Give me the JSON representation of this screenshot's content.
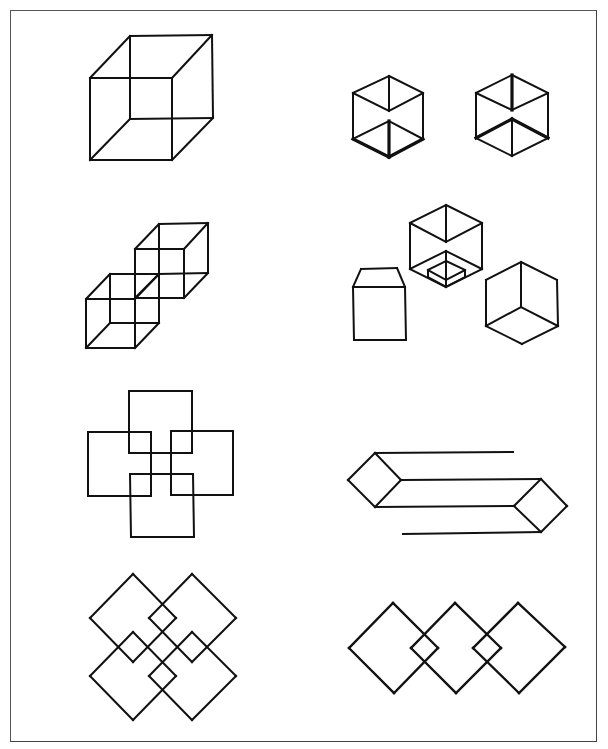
{
  "page": {
    "title": "Figure plate: line drawings of cubes and interlaced squares",
    "frame_color": "#555555",
    "stroke_color": "#111111"
  },
  "figures": [
    {
      "id": "necker-cube",
      "label": "Necker cube",
      "stroke": 2,
      "lines": [
        [
          90,
          78,
          172,
          78
        ],
        [
          172,
          78,
          172,
          160
        ],
        [
          172,
          160,
          90,
          160
        ],
        [
          90,
          160,
          90,
          78
        ],
        [
          130,
          36,
          212,
          35
        ],
        [
          212,
          35,
          213,
          118
        ],
        [
          213,
          118,
          130,
          119
        ],
        [
          130,
          119,
          130,
          36
        ],
        [
          90,
          78,
          130,
          36
        ],
        [
          172,
          78,
          212,
          35
        ],
        [
          172,
          160,
          213,
          118
        ],
        [
          90,
          160,
          130,
          119
        ]
      ]
    },
    {
      "id": "hexagon-cube-left",
      "label": "Hexagonal cube outline (left)",
      "stroke": 2,
      "lines": [
        [
          389,
          76,
          423,
          93
        ],
        [
          423,
          93,
          423,
          139
        ],
        [
          423,
          139,
          389,
          157
        ],
        [
          389,
          157,
          353,
          139
        ],
        [
          353,
          139,
          353,
          93
        ],
        [
          353,
          93,
          389,
          76
        ],
        [
          389,
          76,
          389,
          111
        ],
        [
          353,
          93,
          389,
          111
        ],
        [
          423,
          93,
          389,
          111
        ],
        [
          389,
          121,
          389,
          157
        ],
        [
          353,
          139,
          389,
          121
        ],
        [
          423,
          139,
          389,
          121
        ]
      ],
      "thick": [
        [
          353,
          139,
          389,
          157
        ],
        [
          389,
          157,
          423,
          139
        ],
        [
          389,
          121,
          389,
          157
        ]
      ]
    },
    {
      "id": "hexagon-cube-right",
      "label": "Hexagonal cube outline (right)",
      "stroke": 2,
      "lines": [
        [
          512,
          75,
          548,
          93
        ],
        [
          548,
          93,
          548,
          138
        ],
        [
          548,
          138,
          512,
          156
        ],
        [
          512,
          156,
          476,
          138
        ],
        [
          476,
          138,
          476,
          93
        ],
        [
          476,
          93,
          512,
          75
        ],
        [
          512,
          75,
          512,
          110
        ],
        [
          476,
          93,
          512,
          110
        ],
        [
          548,
          93,
          512,
          110
        ],
        [
          512,
          119,
          512,
          156
        ],
        [
          476,
          138,
          512,
          119
        ],
        [
          548,
          138,
          512,
          119
        ]
      ],
      "thick": [
        [
          512,
          75,
          512,
          110
        ],
        [
          476,
          138,
          512,
          119
        ],
        [
          548,
          138,
          512,
          119
        ]
      ]
    },
    {
      "id": "double-cube",
      "label": "Two joined wire cubes",
      "stroke": 2,
      "lines": [
        [
          86,
          299,
          135,
          299
        ],
        [
          135,
          299,
          135,
          348
        ],
        [
          135,
          348,
          86,
          348
        ],
        [
          86,
          348,
          86,
          299
        ],
        [
          110,
          274,
          159,
          274
        ],
        [
          159,
          274,
          159,
          323
        ],
        [
          159,
          323,
          110,
          323
        ],
        [
          110,
          323,
          110,
          274
        ],
        [
          86,
          299,
          110,
          274
        ],
        [
          135,
          299,
          159,
          274
        ],
        [
          135,
          348,
          159,
          323
        ],
        [
          86,
          348,
          110,
          323
        ],
        [
          135,
          249,
          184,
          249
        ],
        [
          184,
          249,
          184,
          298
        ],
        [
          184,
          298,
          135,
          298
        ],
        [
          135,
          298,
          135,
          249
        ],
        [
          159,
          224,
          208,
          223
        ],
        [
          208,
          223,
          208,
          273
        ],
        [
          208,
          273,
          159,
          274
        ],
        [
          159,
          274,
          159,
          224
        ],
        [
          135,
          249,
          159,
          224
        ],
        [
          184,
          249,
          208,
          223
        ],
        [
          184,
          298,
          208,
          273
        ],
        [
          135,
          298,
          159,
          274
        ]
      ]
    },
    {
      "id": "box-with-lid",
      "label": "Box with tapered top",
      "stroke": 2,
      "lines": [
        [
          353,
          287,
          405,
          287
        ],
        [
          405,
          287,
          406,
          340
        ],
        [
          406,
          340,
          354,
          340
        ],
        [
          354,
          340,
          353,
          287
        ],
        [
          353,
          287,
          361,
          269
        ],
        [
          361,
          269,
          397,
          268
        ],
        [
          397,
          268,
          405,
          287
        ]
      ]
    },
    {
      "id": "open-cube-with-inset",
      "label": "Hexagonal cube with inner square well",
      "stroke": 2,
      "lines": [
        [
          446,
          205,
          482,
          223
        ],
        [
          482,
          223,
          482,
          269
        ],
        [
          482,
          269,
          446,
          287
        ],
        [
          446,
          287,
          410,
          269
        ],
        [
          410,
          269,
          410,
          223
        ],
        [
          410,
          223,
          446,
          205
        ],
        [
          446,
          205,
          446,
          242
        ],
        [
          410,
          223,
          446,
          242
        ],
        [
          482,
          223,
          446,
          242
        ],
        [
          410,
          269,
          446,
          251
        ],
        [
          482,
          269,
          446,
          251
        ],
        [
          446,
          251,
          446,
          287
        ],
        [
          428,
          270,
          446,
          261
        ],
        [
          446,
          261,
          465,
          270
        ],
        [
          428,
          270,
          428,
          277
        ],
        [
          465,
          270,
          465,
          277
        ],
        [
          428,
          277,
          446,
          287
        ],
        [
          465,
          277,
          446,
          287
        ],
        [
          428,
          270,
          446,
          280
        ],
        [
          465,
          270,
          446,
          280
        ]
      ]
    },
    {
      "id": "corner-cube",
      "label": "Hexagonal cube seen from below",
      "stroke": 2,
      "lines": [
        [
          521,
          262,
          557,
          280
        ],
        [
          557,
          280,
          558,
          326
        ],
        [
          558,
          326,
          522,
          344
        ],
        [
          522,
          344,
          486,
          326
        ],
        [
          486,
          326,
          486,
          280
        ],
        [
          486,
          280,
          521,
          262
        ],
        [
          521,
          262,
          521,
          307
        ],
        [
          486,
          326,
          521,
          307
        ],
        [
          558,
          326,
          521,
          307
        ]
      ]
    },
    {
      "id": "interlocked-squares-cross",
      "label": "Four overlapping squares in cross arrangement",
      "stroke": 2,
      "lines": [
        [
          129,
          391,
          192,
          391
        ],
        [
          192,
          391,
          192,
          453
        ],
        [
          192,
          453,
          129,
          453
        ],
        [
          129,
          453,
          129,
          391
        ],
        [
          88,
          432,
          151,
          432
        ],
        [
          151,
          432,
          151,
          496
        ],
        [
          151,
          496,
          88,
          496
        ],
        [
          88,
          496,
          88,
          432
        ],
        [
          171,
          431,
          233,
          431
        ],
        [
          233,
          431,
          233,
          495
        ],
        [
          233,
          495,
          171,
          495
        ],
        [
          171,
          495,
          171,
          431
        ],
        [
          130,
          474,
          193,
          474
        ],
        [
          193,
          474,
          194,
          537
        ],
        [
          194,
          537,
          131,
          537
        ],
        [
          131,
          537,
          130,
          474
        ]
      ]
    },
    {
      "id": "impossible-beam",
      "label": "Impossible bar with diamond ends",
      "stroke": 2,
      "lines": [
        [
          375,
          453,
          513,
          452
        ],
        [
          375,
          453,
          401,
          480
        ],
        [
          401,
          480,
          375,
          507
        ],
        [
          375,
          507,
          348,
          480
        ],
        [
          348,
          480,
          375,
          453
        ],
        [
          401,
          480,
          541,
          479
        ],
        [
          375,
          507,
          514,
          506
        ],
        [
          541,
          479,
          567,
          506
        ],
        [
          567,
          506,
          541,
          532
        ],
        [
          541,
          532,
          514,
          506
        ],
        [
          514,
          506,
          541,
          479
        ],
        [
          403,
          534,
          541,
          532
        ]
      ]
    },
    {
      "id": "interlaced-diamonds-four",
      "label": "Four interlaced diamonds",
      "stroke": 2,
      "lines": [
        [
          133,
          574,
          90,
          618
        ],
        [
          90,
          618,
          133,
          662
        ],
        [
          133,
          662,
          176,
          618
        ],
        [
          176,
          618,
          133,
          574
        ],
        [
          192,
          574,
          149,
          618
        ],
        [
          149,
          618,
          192,
          662
        ],
        [
          192,
          662,
          236,
          618
        ],
        [
          236,
          618,
          192,
          574
        ],
        [
          133,
          632,
          90,
          676
        ],
        [
          90,
          676,
          133,
          720
        ],
        [
          133,
          720,
          176,
          676
        ],
        [
          176,
          676,
          133,
          632
        ],
        [
          192,
          632,
          149,
          676
        ],
        [
          149,
          676,
          192,
          720
        ],
        [
          192,
          720,
          236,
          676
        ],
        [
          236,
          676,
          192,
          632
        ]
      ]
    },
    {
      "id": "interlaced-diamonds-three",
      "label": "Three interlaced diamonds in a row",
      "stroke": 2.3,
      "lines": [
        [
          393,
          603,
          349,
          648
        ],
        [
          349,
          648,
          394,
          693
        ],
        [
          394,
          693,
          438,
          648
        ],
        [
          438,
          648,
          393,
          603
        ],
        [
          455,
          603,
          411,
          648
        ],
        [
          411,
          648,
          456,
          693
        ],
        [
          456,
          693,
          501,
          648
        ],
        [
          501,
          648,
          455,
          603
        ],
        [
          518,
          603,
          473,
          648
        ],
        [
          473,
          648,
          519,
          693
        ],
        [
          519,
          693,
          565,
          647
        ],
        [
          565,
          647,
          518,
          603
        ]
      ]
    }
  ]
}
